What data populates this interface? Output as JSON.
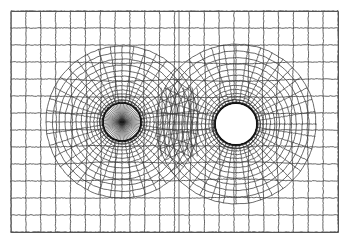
{
  "figure": {
    "title": "Finite element mesh around two circular holes",
    "background_color": "#ffffff",
    "line_color": "#3a3a3a",
    "hole_edge_color": "#1a1a1a",
    "width": 350,
    "height": 245
  },
  "frame": {
    "name": "mesh-domain-boundary",
    "x": 11,
    "y": 11,
    "width": 327,
    "height": 221,
    "stroke": "#555555",
    "stroke_width": 1
  },
  "holes": [
    {
      "name": "left-hole",
      "label": "left circular hole",
      "cx": 122,
      "cy": 122,
      "r": 19,
      "fill": "none",
      "interior_style": "radial-spokes",
      "spoke_count": 72,
      "edge_color": "#141414",
      "edge_width": 1.6
    },
    {
      "name": "right-hole",
      "label": "right circular hole",
      "cx": 236,
      "cy": 124,
      "r": 21,
      "fill": "#ffffff",
      "interior_style": "empty",
      "spoke_count": 0,
      "edge_color": "#141414",
      "edge_width": 1.8
    }
  ],
  "mesh": {
    "type": "quadrilateral",
    "radial_rings_left": 13,
    "radial_rings_right": 13,
    "circumferential_divisions": 40,
    "background_grid_cols": 22,
    "background_grid_rows": 13,
    "transition_zone": "between-holes",
    "symmetry_line_x": 179,
    "description": "Structured O-grid refined near each hole, blended into a quasi-rectangular background grid"
  },
  "chart_data": {
    "type": "diagram",
    "title": "Finite element mesh around two circular holes",
    "xlabel": "",
    "ylabel": ""
  }
}
